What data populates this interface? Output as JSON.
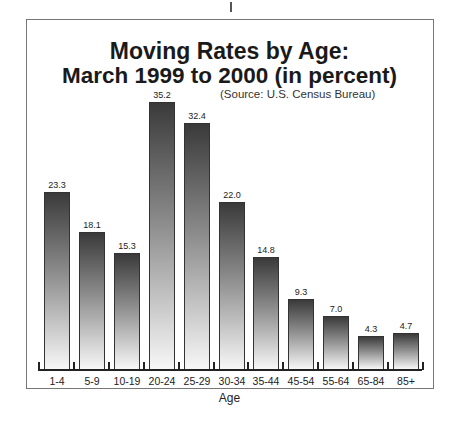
{
  "chart_data": {
    "type": "bar",
    "title": "Moving Rates by Age:",
    "subtitle": "March 1999 to 2000 (in percent)",
    "source": "(Source: U.S. Census Bureau)",
    "xlabel": "Age",
    "ylabel": "",
    "categories": [
      "1-4",
      "5-9",
      "10-19",
      "20-24",
      "25-29",
      "30-34",
      "35-44",
      "45-54",
      "55-64",
      "65-84",
      "85+"
    ],
    "values": [
      23.3,
      18.1,
      15.3,
      35.2,
      32.4,
      22.0,
      14.8,
      9.3,
      7.0,
      4.3,
      4.7
    ],
    "value_labels": [
      "23.3",
      "18.1",
      "15.3",
      "35.2",
      "32.4",
      "22.0",
      "14.8",
      "9.3",
      "7.0",
      "4.3",
      "4.7"
    ],
    "ylim": [
      0,
      36
    ],
    "grid": false,
    "legend": "none"
  }
}
